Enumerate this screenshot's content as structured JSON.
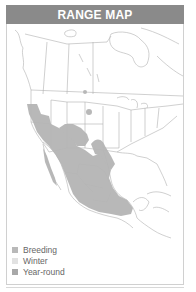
{
  "header": {
    "title": "RANGE MAP"
  },
  "legend": {
    "items": [
      {
        "label": "Breeding",
        "color": "#b9b9b9"
      },
      {
        "label": "Winter",
        "color": "#e2e2e2"
      },
      {
        "label": "Year-round",
        "color": "#a8a8a8"
      }
    ]
  },
  "colors": {
    "header_bg": "#8a8a8a",
    "range_fill": "#b5b5b5",
    "border_lines": "#9a9a9a"
  }
}
